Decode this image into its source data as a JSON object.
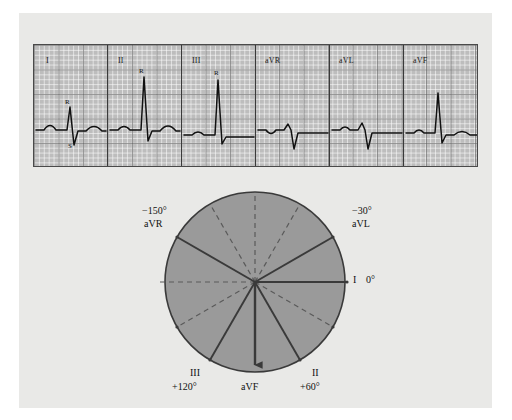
{
  "figure": {
    "title": "",
    "background_color": "#e9e9e7",
    "panel_color": "#e9e9e7"
  },
  "ecg_strip": {
    "paper_color": "#bdbdbd",
    "trace_color": "#111111",
    "leads": [
      {
        "label": "I",
        "wave_annotations": [
          {
            "text": "R",
            "position": "above-r-wave"
          },
          {
            "text": "S",
            "position": "below-s-wave"
          }
        ]
      },
      {
        "label": "II",
        "wave_annotations": [
          {
            "text": "R",
            "position": "above-r-wave"
          }
        ]
      },
      {
        "label": "III",
        "wave_annotations": [
          {
            "text": "R",
            "position": "above-r-wave"
          }
        ]
      },
      {
        "label": "aVR",
        "wave_annotations": []
      },
      {
        "label": "aVL",
        "wave_annotations": []
      },
      {
        "label": "aVF",
        "wave_annotations": []
      }
    ]
  },
  "hexaxial": {
    "circle_fill": "#9a9a9a",
    "circle_stroke": "#3a3a3a",
    "axis_solid_color": "#3a3a3a",
    "axis_dashed_color": "#5a5a5a",
    "arrow_lead": "aVF",
    "axes": [
      {
        "lead": "I",
        "degrees": "0°",
        "angle": 0,
        "style": "solid",
        "label_position": "right"
      },
      {
        "lead": "II",
        "degrees": "+60°",
        "angle": 60,
        "style": "solid",
        "label_position": "bottom-right"
      },
      {
        "lead": "III",
        "degrees": "+120°",
        "angle": 120,
        "style": "solid",
        "label_position": "bottom-left"
      },
      {
        "lead": "aVR",
        "degrees": "−150°",
        "angle": -150,
        "style": "solid",
        "label_position": "top-left"
      },
      {
        "lead": "aVL",
        "degrees": "−30°",
        "angle": -30,
        "style": "solid",
        "label_position": "top-right"
      },
      {
        "lead": "aVF",
        "degrees": "",
        "angle": 90,
        "style": "solid-arrow",
        "label_position": "bottom"
      }
    ],
    "labels": {
      "aVR_deg": "−150°",
      "aVR_lead": "aVR",
      "aVL_deg": "−30°",
      "aVL_lead": "aVL",
      "I_lead": "I",
      "I_deg": "0°",
      "III_lead": "III",
      "III_deg": "+120°",
      "II_lead": "II",
      "II_deg": "+60°",
      "aVF_lead": "aVF"
    }
  }
}
